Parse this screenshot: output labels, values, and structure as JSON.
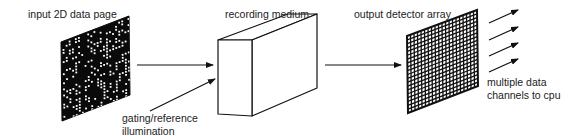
{
  "diagram": {
    "labels": {
      "input_page": "input 2D data page",
      "recording_medium": "recording medium",
      "output_detector": "output detector array",
      "gating_line1": "gating/reference",
      "gating_line2": "illumination",
      "channels_line1": "multiple data",
      "channels_line2": "channels to cpu"
    },
    "nodes": [
      {
        "id": "data_page",
        "label": "input 2D data page",
        "shape": "parallelogram-dotted"
      },
      {
        "id": "medium",
        "label": "recording medium",
        "shape": "3d-box"
      },
      {
        "id": "detector",
        "label": "output detector array",
        "shape": "parallelogram-grid",
        "grid_size": 20
      },
      {
        "id": "cpu_channels",
        "label": "multiple data channels to cpu",
        "shape": "arrows",
        "count": 4
      }
    ],
    "edges": [
      {
        "from": "data_page",
        "to": "medium"
      },
      {
        "from": "gating_reference_illumination",
        "to": "medium"
      },
      {
        "from": "medium",
        "to": "detector"
      },
      {
        "from": "detector",
        "to": "cpu_channels"
      }
    ],
    "colors": {
      "stroke": "#111111",
      "page_fill": "#0a0a0a",
      "dot": "#ffffff",
      "text": "#222222"
    }
  }
}
